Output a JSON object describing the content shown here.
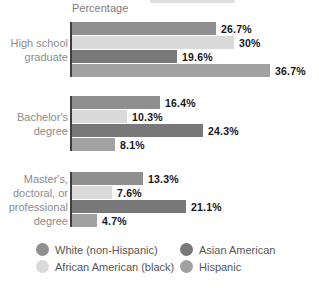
{
  "axis_title": "Percentage",
  "colors": {
    "white_non_hispanic": "#8f8f8f",
    "african_american": "#dadada",
    "asian_american": "#787878",
    "hispanic": "#a1a1a1",
    "axis_line": "#3f3f3f",
    "category_text": "#8c8c8c",
    "value_text": "#161616",
    "legend_text": "#565656",
    "background": "#ffffff"
  },
  "chart_data": {
    "type": "bar",
    "orientation": "horizontal",
    "title": "",
    "xlabel": "Percentage",
    "ylabel": "",
    "xlim": [
      0,
      40
    ],
    "grid": false,
    "legend_position": "bottom",
    "categories": [
      {
        "label": "High school graduate",
        "lines": [
          "High school",
          "graduate"
        ]
      },
      {
        "label": "Bachelor's degree",
        "lines": [
          "Bachelor's",
          "degree"
        ]
      },
      {
        "label": "Master's, doctoral, or professional degree",
        "lines": [
          "Master's,",
          "doctoral, or",
          "professional",
          "degree"
        ]
      }
    ],
    "series": [
      {
        "name": "White (non-Hispanic)",
        "color_key": "white_non_hispanic",
        "values": [
          26.7,
          16.4,
          13.3
        ],
        "labels": [
          "26.7%",
          "16.4%",
          "13.3%"
        ]
      },
      {
        "name": "African American (black)",
        "color_key": "african_american",
        "values": [
          30,
          10.3,
          7.6
        ],
        "labels": [
          "30%",
          "10.3%",
          "7.6%"
        ]
      },
      {
        "name": "Asian American",
        "color_key": "asian_american",
        "values": [
          19.6,
          24.3,
          21.1
        ],
        "labels": [
          "19.6%",
          "24.3%",
          "21.1%"
        ]
      },
      {
        "name": "Hispanic",
        "color_key": "hispanic",
        "values": [
          36.7,
          8.1,
          4.7
        ],
        "labels": [
          "36.7%",
          "8.1%",
          "4.7%"
        ]
      }
    ]
  },
  "legend": {
    "items": [
      {
        "label": "White (non-Hispanic)",
        "color_key": "white_non_hispanic"
      },
      {
        "label": "Asian American",
        "color_key": "asian_american"
      },
      {
        "label": "African American (black)",
        "color_key": "african_american"
      },
      {
        "label": "Hispanic",
        "color_key": "hispanic"
      }
    ]
  }
}
